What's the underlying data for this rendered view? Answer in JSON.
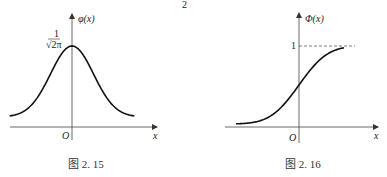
{
  "page_marker": "2",
  "chart_data": [
    {
      "type": "line",
      "title": "",
      "caption": "图 2. 15",
      "xlabel": "x",
      "ylabel": "φ(x)",
      "origin_label": "O",
      "peak_label_num": "1",
      "peak_label_den": "√2π",
      "function": "standard normal density",
      "x": [
        -3,
        -2.5,
        -2,
        -1.5,
        -1,
        -0.5,
        0,
        0.5,
        1,
        1.5,
        2,
        2.5,
        3
      ],
      "y": [
        0.0044,
        0.0175,
        0.054,
        0.1295,
        0.242,
        0.3521,
        0.3989,
        0.3521,
        0.242,
        0.1295,
        0.054,
        0.0175,
        0.0044
      ],
      "xlim": [
        -3,
        3
      ],
      "ylim": [
        0,
        0.45
      ],
      "grid": false
    },
    {
      "type": "line",
      "title": "",
      "caption": "图 2. 16",
      "xlabel": "x",
      "ylabel": "Φ(x)",
      "origin_label": "O",
      "asymptote_label": "1",
      "asymptote_value": 1,
      "function": "standard normal CDF",
      "x": [
        -3,
        -2.5,
        -2,
        -1.5,
        -1,
        -0.5,
        0,
        0.5,
        1,
        1.5,
        2
      ],
      "y": [
        0.0013,
        0.0062,
        0.0228,
        0.0668,
        0.1587,
        0.3085,
        0.5,
        0.6915,
        0.8413,
        0.9332,
        0.9772
      ],
      "xlim": [
        -3,
        2
      ],
      "ylim": [
        0,
        1.1
      ],
      "grid": false
    }
  ]
}
